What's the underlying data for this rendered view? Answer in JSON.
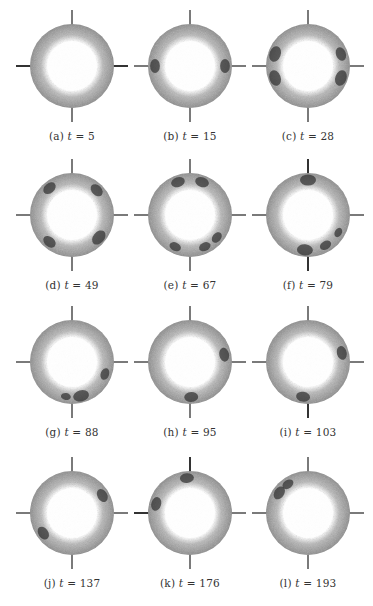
{
  "figure": {
    "ring_style": {
      "outer_color": "#8a8a8a",
      "mid_color": "#b8b8b8",
      "inner_color": "#ffffff",
      "spoke_color": "#7a7a7a",
      "cluster_color": "#2e2e2e"
    },
    "panels": [
      {
        "label": "(a)",
        "t_text": "t",
        "eq": " = 5",
        "clusters": [],
        "dark_spokes": [
          "left",
          "right"
        ]
      },
      {
        "label": "(b)",
        "t_text": "t",
        "eq": " = 15",
        "clusters": [
          {
            "angle": 180,
            "size": 7
          },
          {
            "angle": 0,
            "size": 7
          }
        ],
        "dark_spokes": []
      },
      {
        "label": "(c)",
        "t_text": "t",
        "eq": " = 28",
        "clusters": [
          {
            "angle": 160,
            "size": 8
          },
          {
            "angle": 200,
            "size": 8
          },
          {
            "angle": 20,
            "size": 7
          },
          {
            "angle": 340,
            "size": 8
          }
        ],
        "dark_spokes": []
      },
      {
        "label": "(d)",
        "t_text": "t",
        "eq": " = 49",
        "clusters": [
          {
            "angle": 130,
            "size": 7
          },
          {
            "angle": 45,
            "size": 7
          },
          {
            "angle": 230,
            "size": 7
          },
          {
            "angle": 320,
            "size": 8
          }
        ],
        "dark_spokes": []
      },
      {
        "label": "(e)",
        "t_text": "t",
        "eq": " = 67",
        "clusters": [
          {
            "angle": 110,
            "size": 7
          },
          {
            "angle": 70,
            "size": 7
          },
          {
            "angle": 245,
            "size": 6
          },
          {
            "angle": 295,
            "size": 6
          },
          {
            "angle": 320,
            "size": 6
          }
        ],
        "dark_spokes": []
      },
      {
        "label": "(f)",
        "t_text": "t",
        "eq": " = 79",
        "clusters": [
          {
            "angle": 90,
            "size": 8
          },
          {
            "angle": 265,
            "size": 8
          },
          {
            "angle": 300,
            "size": 6
          },
          {
            "angle": 330,
            "size": 5
          }
        ],
        "dark_spokes": [
          "top",
          "bottom"
        ]
      },
      {
        "label": "(g)",
        "t_text": "t",
        "eq": " = 88",
        "clusters": [
          {
            "angle": 340,
            "size": 6
          },
          {
            "angle": 285,
            "size": 8
          },
          {
            "angle": 260,
            "size": 5
          }
        ],
        "dark_spokes": []
      },
      {
        "label": "(h)",
        "t_text": "t",
        "eq": " = 95",
        "clusters": [
          {
            "angle": 12,
            "size": 7
          },
          {
            "angle": 272,
            "size": 7
          }
        ],
        "dark_spokes": []
      },
      {
        "label": "(i)",
        "t_text": "t",
        "eq": " = 103",
        "clusters": [
          {
            "angle": 15,
            "size": 7
          },
          {
            "angle": 262,
            "size": 7
          }
        ],
        "dark_spokes": [
          "bottom"
        ]
      },
      {
        "label": "(j)",
        "t_text": "t",
        "eq": " = 137",
        "clusters": [
          {
            "angle": 30,
            "size": 7
          },
          {
            "angle": 215,
            "size": 7
          }
        ],
        "dark_spokes": []
      },
      {
        "label": "(k)",
        "t_text": "t",
        "eq": " = 176",
        "clusters": [
          {
            "angle": 95,
            "size": 7
          },
          {
            "angle": 165,
            "size": 7
          }
        ],
        "dark_spokes": [
          "top",
          "left"
        ]
      },
      {
        "label": "(l)",
        "t_text": "t",
        "eq": " = 193",
        "clusters": [
          {
            "angle": 145,
            "size": 7
          },
          {
            "angle": 125,
            "size": 6
          }
        ],
        "dark_spokes": []
      }
    ]
  }
}
